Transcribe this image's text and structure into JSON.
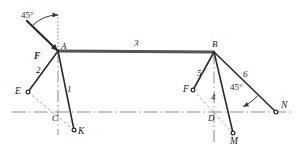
{
  "figure": {
    "type": "structural-truss-free-body-diagram",
    "background": "#ffffff",
    "line_color": "#2b2b2b",
    "beam_color": "#555555",
    "centerline_color": "#8d8d8d",
    "dashed_color": "#9a9a9a",
    "width": 297,
    "height": 157
  },
  "nodes": [
    {
      "id": "A",
      "label": "A",
      "x": 58,
      "y": 51,
      "label_x": 61,
      "label_y": 42,
      "marker": false
    },
    {
      "id": "B",
      "label": "B",
      "x": 214,
      "y": 52,
      "label_x": 212,
      "label_y": 40,
      "marker": false
    },
    {
      "id": "C",
      "label": "C",
      "x": 58,
      "y": 112,
      "label_x": 52,
      "label_y": 114,
      "marker": false
    },
    {
      "id": "D",
      "label": "D",
      "x": 214,
      "y": 112,
      "label_x": 208,
      "label_y": 114,
      "marker": false
    },
    {
      "id": "E",
      "label": "E",
      "x": 28,
      "y": 92,
      "label_x": 15,
      "label_y": 87,
      "marker": true
    },
    {
      "id": "F1",
      "label": "F",
      "x": 46,
      "y": 57,
      "label_x": 34,
      "label_y": 52,
      "marker": false
    },
    {
      "id": "F2",
      "label": "F",
      "x": 193,
      "y": 90,
      "label_x": 183,
      "label_y": 85,
      "marker": true
    },
    {
      "id": "K",
      "label": "K",
      "x": 74,
      "y": 130,
      "label_x": 78,
      "label_y": 127,
      "marker": true
    },
    {
      "id": "M",
      "label": "M",
      "x": 233,
      "y": 133,
      "label_x": 230,
      "label_y": 137,
      "marker": true
    },
    {
      "id": "N",
      "label": "N",
      "x": 276,
      "y": 112,
      "label_x": 281,
      "label_y": 101,
      "marker": true
    }
  ],
  "members": [
    {
      "id": "m1",
      "label": "1",
      "from": "A",
      "to": "K",
      "label_x": 67,
      "label_y": 85
    },
    {
      "id": "m2",
      "label": "2",
      "from": "A",
      "to": "E",
      "label_x": 36,
      "label_y": 66
    },
    {
      "id": "m3",
      "label": "3",
      "from": "A",
      "to": "B",
      "label_x": 134,
      "label_y": 39
    },
    {
      "id": "m4",
      "label": "4",
      "from": "B",
      "to": "M",
      "label_x": 211,
      "label_y": 93
    },
    {
      "id": "m5",
      "label": "5",
      "from": "B",
      "to": "F2",
      "label_x": 197,
      "label_y": 69
    },
    {
      "id": "m6",
      "label": "6",
      "from": "B",
      "to": "N",
      "label_x": 243,
      "label_y": 70
    }
  ],
  "force_arrows": [
    {
      "id": "force-F-left",
      "label": "F",
      "from_x": 27,
      "from_y": 21,
      "to_x": 58,
      "to_y": 51,
      "label_x": 34,
      "label_y": 52
    },
    {
      "id": "angle-arrow-left",
      "from_x": 32,
      "from_y": 28,
      "to_x": 54,
      "to_y": 20
    }
  ],
  "angles": [
    {
      "id": "angle-left",
      "label": "45°",
      "label_x": 21,
      "label_y": 11,
      "vertex_x": 58,
      "vertex_y": 51,
      "radius": 36,
      "start_deg": 225,
      "end_deg": 270
    },
    {
      "id": "angle-right",
      "label": "45°",
      "label_x": 230,
      "label_y": 83,
      "vertex_x": 214,
      "vertex_y": 52,
      "radius": 62,
      "start_deg": 45,
      "end_deg": 62
    }
  ],
  "reference_lines": [
    {
      "id": "vertical-dotted-A",
      "x1": 58,
      "y1": 14,
      "x2": 58,
      "y2": 51,
      "style": "dotted"
    },
    {
      "id": "vertical-centerline-C",
      "x1": 58,
      "y1": 51,
      "x2": 58,
      "y2": 135,
      "style": "dashdot"
    },
    {
      "id": "vertical-centerline-D",
      "x1": 214,
      "y1": 52,
      "x2": 214,
      "y2": 142,
      "style": "dashdot"
    },
    {
      "id": "horizontal-centerline-left",
      "x1": 12,
      "y1": 112,
      "x2": 122,
      "y2": 112,
      "style": "dashdot"
    },
    {
      "id": "horizontal-centerline-right",
      "x1": 122,
      "y1": 112,
      "x2": 292,
      "y2": 112,
      "style": "dashdot"
    },
    {
      "id": "dashed-E-K",
      "x1": 28,
      "y1": 92,
      "x2": 74,
      "y2": 130,
      "style": "dashed"
    },
    {
      "id": "dashed-F2-M",
      "x1": 193,
      "y1": 90,
      "x2": 233,
      "y2": 133,
      "style": "dashed"
    },
    {
      "id": "dashed-N-tick",
      "x1": 269,
      "y1": 105,
      "x2": 276,
      "y2": 112,
      "style": "dashed"
    }
  ],
  "beam": {
    "id": "main-beam",
    "x1": 58,
    "y1": 51,
    "x2": 214,
    "y2": 52,
    "thickness": 3
  }
}
